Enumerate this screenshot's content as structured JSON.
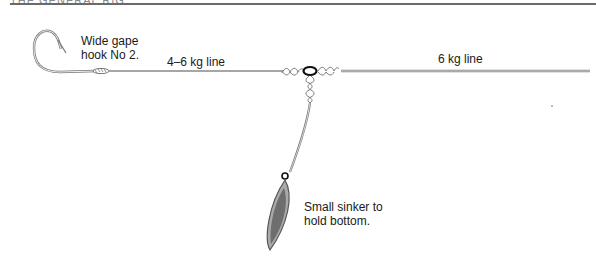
{
  "diagram": {
    "header_fragment": "THE GENERAL RIG",
    "labels": {
      "hook": "Wide gape\nhook No 2.",
      "hook_line1": "Wide gape",
      "hook_line2": "hook No 2.",
      "leader_line": "4–6 kg line",
      "main_line": "6 kg line",
      "sinker_line1": "Small sinker to",
      "sinker_line2": "hold bottom."
    },
    "components": [
      {
        "name": "hook",
        "description": "Wide gape hook No 2"
      },
      {
        "name": "leader",
        "description": "4–6 kg line"
      },
      {
        "name": "swivel",
        "description": "three-way swivel with knots"
      },
      {
        "name": "main-line",
        "description": "6 kg line"
      },
      {
        "name": "dropper",
        "description": "dropper line to sinker"
      },
      {
        "name": "sinker",
        "description": "Small sinker to hold bottom"
      }
    ],
    "colors": {
      "line": "#7a7a7a",
      "sinker_fill": "#6e6e6e",
      "sinker_outline": "#555555",
      "text": "#1a1a1a",
      "rule": "#6a6a6a"
    }
  }
}
